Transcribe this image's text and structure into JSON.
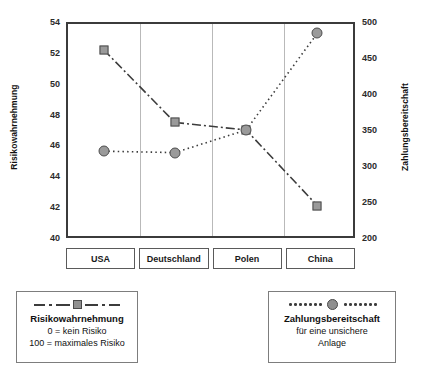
{
  "chart_data": {
    "type": "line",
    "title": "",
    "categories": [
      "USA",
      "Deutschland",
      "Polen",
      "China"
    ],
    "grid": true,
    "legend_position": "below",
    "series": [
      {
        "name": "Risikowahrnehmung",
        "axis": "left",
        "marker": "square",
        "linestyle": "dash-dot",
        "values": [
          52.3,
          47.5,
          47.0,
          42.0
        ]
      },
      {
        "name": "Zahlungsbereitschaft",
        "axis": "right",
        "marker": "circle",
        "linestyle": "dotted",
        "values": [
          320,
          318,
          350,
          487
        ]
      }
    ],
    "xlabel": "",
    "ylabel": "Risikowahrnehmung",
    "ylabel_right": "Zahlungsbereitschaft",
    "ylim": [
      40,
      54
    ],
    "yticks": [
      40,
      42,
      44,
      46,
      48,
      50,
      52,
      54
    ],
    "ylim_right": [
      200,
      500
    ],
    "yticks_right": [
      200,
      250,
      300,
      350,
      400,
      450,
      500
    ]
  },
  "axes": {
    "left_title": "Risikowahrnehmung",
    "right_title": "Zahlungsbereitschaft"
  },
  "legend": {
    "left": {
      "title": "Risikowahrnehmung",
      "line1": "0 = kein Risiko",
      "line2": "100 = maximales Risiko"
    },
    "right": {
      "title": "Zahlungsbereitschaft",
      "line1": "für eine unsichere",
      "line2": "Anlage"
    }
  },
  "colors": {
    "frame": "#3b3b3b",
    "gridline": "#b9b9b9",
    "series_line": "#3c3c3c",
    "marker_fill": "#9a9a9a",
    "marker_stroke": "#4d4d4d",
    "text": "#1a1a1a"
  }
}
